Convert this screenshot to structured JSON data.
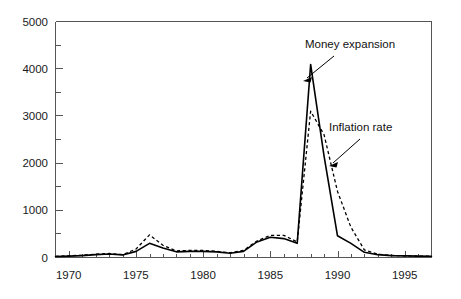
{
  "chart_data": {
    "type": "line",
    "title": "",
    "subtitle": "",
    "xlabel": "",
    "ylabel": "",
    "xlim": [
      1969,
      1997
    ],
    "ylim": [
      0,
      5000
    ],
    "grid": false,
    "legend_position": "inline-annotations",
    "y_ticks_major": [
      "0",
      "1000",
      "2000",
      "3000",
      "4000",
      "5000"
    ],
    "y_tick_values": [
      0,
      1000,
      2000,
      3000,
      4000,
      5000
    ],
    "y_minor_tick_step": 500,
    "x_ticks_major": [
      "1970",
      "1975",
      "1980",
      "1985",
      "1990",
      "1995"
    ],
    "x_tick_values": [
      1970,
      1975,
      1980,
      1985,
      1990,
      1995
    ],
    "x_minor_tick_step": 1,
    "x": [
      1969,
      1970,
      1971,
      1972,
      1973,
      1974,
      1975,
      1976,
      1977,
      1978,
      1979,
      1980,
      1981,
      1982,
      1983,
      1984,
      1985,
      1986,
      1987,
      1988,
      1989,
      1990,
      1991,
      1992,
      1993,
      1994,
      1995,
      1996,
      1997
    ],
    "series": [
      {
        "name": "Money expansion",
        "style": "solid",
        "color": "#000000",
        "values": [
          20,
          30,
          40,
          60,
          75,
          55,
          130,
          300,
          200,
          120,
          130,
          130,
          120,
          90,
          130,
          330,
          430,
          400,
          300,
          4090,
          2150,
          460,
          300,
          110,
          60,
          40,
          35,
          30,
          25
        ]
      },
      {
        "name": "Inflation rate",
        "style": "dashed",
        "color": "#000000",
        "values": [
          25,
          35,
          50,
          70,
          85,
          60,
          180,
          480,
          260,
          140,
          150,
          150,
          130,
          100,
          150,
          350,
          470,
          470,
          330,
          3100,
          2600,
          1400,
          640,
          160,
          70,
          45,
          35,
          30,
          25
        ]
      }
    ],
    "annotations": [
      {
        "id": "money-expansion",
        "text": "Money expansion",
        "label_x": 305,
        "label_y": 48,
        "arrow_from": [
          334,
          56
        ],
        "arrow_to": [
          305,
          80
        ]
      },
      {
        "id": "inflation-rate",
        "text": "Inflation rate",
        "label_x": 329,
        "label_y": 131,
        "arrow_from": [
          360,
          139
        ],
        "arrow_to": [
          331,
          165
        ]
      }
    ]
  },
  "axis": {
    "y_labels": [
      "5000",
      "4000",
      "3000",
      "2000",
      "1000",
      "0"
    ],
    "x_labels": [
      "1970",
      "1975",
      "1980",
      "1985",
      "1990",
      "1995"
    ]
  },
  "annotations": {
    "money_expansion": "Money expansion",
    "inflation_rate": "Inflation rate"
  }
}
